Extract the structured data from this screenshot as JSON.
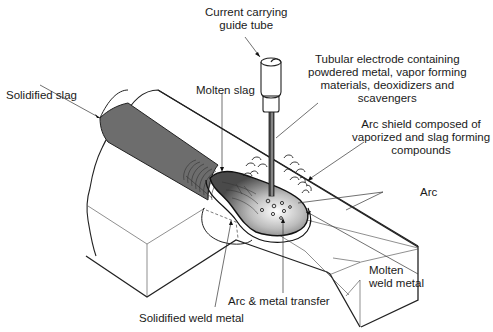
{
  "diagram": {
    "labels": {
      "guide_tube": [
        "Current carrying",
        "guide tube"
      ],
      "electrode": [
        "Tubular electrode containing",
        "powdered metal, vapor forming",
        "materials, deoxidizers and",
        "scavengers"
      ],
      "solidified_slag": "Solidified slag",
      "molten_slag": "Molten slag",
      "arc_shield": [
        "Arc shield composed of",
        "vaporized and slag forming",
        "compounds"
      ],
      "arc": "Arc",
      "molten_weld_metal": [
        "Molten",
        "weld metal"
      ],
      "arc_metal_transfer": "Arc & metal transfer",
      "solidified_weld_metal": "Solidified weld metal"
    },
    "colors": {
      "line": "#222222",
      "slag_fill": "#6e6e6e",
      "pool_light": "#f2f2f2",
      "pool_dark": "#555555",
      "background": "#ffffff"
    }
  }
}
